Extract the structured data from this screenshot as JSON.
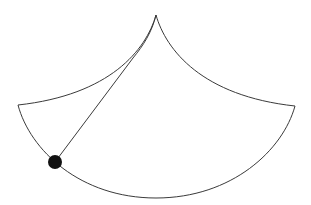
{
  "diagram": {
    "title": "",
    "colors": {
      "stroke": "#3a3a3a",
      "bob": "#111111",
      "background": "#ffffff"
    },
    "cusp": {
      "x": 156,
      "y": 15
    },
    "left_corner": {
      "x": 18,
      "y": 105
    },
    "right_corner": {
      "x": 295,
      "y": 106
    },
    "bottom": {
      "x": 156,
      "y": 198
    },
    "string_tangent_point": {
      "x": 133,
      "y": 58
    },
    "bob": {
      "x": 55,
      "y": 162,
      "r": 7
    }
  }
}
